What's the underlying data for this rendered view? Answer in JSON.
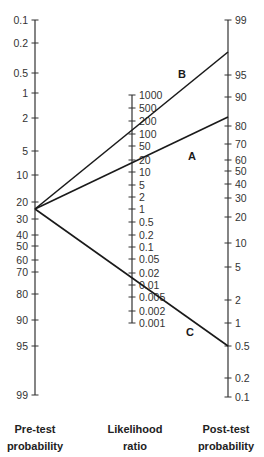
{
  "figure": {
    "type": "Fagan nomogram",
    "axes": {
      "pretest": {
        "caption_line1": "Pre-test",
        "caption_line2": "probability",
        "x": 35,
        "ticks": [
          {
            "label": "0.1",
            "y": 20
          },
          {
            "label": "0.2",
            "y": 43
          },
          {
            "label": "0.5",
            "y": 73
          },
          {
            "label": "1",
            "y": 93
          },
          {
            "label": "2",
            "y": 118
          },
          {
            "label": "5",
            "y": 151
          },
          {
            "label": "10",
            "y": 175
          },
          {
            "label": "20",
            "y": 202
          },
          {
            "label": "30",
            "y": 219
          },
          {
            "label": "40",
            "y": 235
          },
          {
            "label": "50",
            "y": 246
          },
          {
            "label": "60",
            "y": 260
          },
          {
            "label": "70",
            "y": 272
          },
          {
            "label": "80",
            "y": 294
          },
          {
            "label": "90",
            "y": 320
          },
          {
            "label": "95",
            "y": 346
          },
          {
            "label": "99",
            "y": 395
          }
        ]
      },
      "likelihood_ratio": {
        "caption_line1": "Likelihood",
        "caption_line2": "ratio",
        "x": 132,
        "ticks": [
          {
            "label": "1000",
            "y": 95
          },
          {
            "label": "500",
            "y": 108
          },
          {
            "label": "200",
            "y": 121
          },
          {
            "label": "100",
            "y": 134
          },
          {
            "label": "50",
            "y": 146
          },
          {
            "label": "20",
            "y": 160
          },
          {
            "label": "10",
            "y": 172
          },
          {
            "label": "5",
            "y": 185
          },
          {
            "label": "2",
            "y": 197
          },
          {
            "label": "1",
            "y": 209
          },
          {
            "label": "0.5",
            "y": 222
          },
          {
            "label": "0.2",
            "y": 235
          },
          {
            "label": "0.1",
            "y": 247
          },
          {
            "label": "0.05",
            "y": 259
          },
          {
            "label": "0.02",
            "y": 273
          },
          {
            "label": "0.01",
            "y": 285
          },
          {
            "label": "0.005",
            "y": 297
          },
          {
            "label": "0.002",
            "y": 311
          },
          {
            "label": "0.001",
            "y": 323
          }
        ]
      },
      "posttest": {
        "caption_line1": "Post-test",
        "caption_line2": "probability",
        "x": 228,
        "ticks": [
          {
            "label": "99",
            "y": 20
          },
          {
            "label": "95",
            "y": 75
          },
          {
            "label": "90",
            "y": 97
          },
          {
            "label": "80",
            "y": 126
          },
          {
            "label": "70",
            "y": 144
          },
          {
            "label": "60",
            "y": 160
          },
          {
            "label": "50",
            "y": 171
          },
          {
            "label": "40",
            "y": 184
          },
          {
            "label": "30",
            "y": 198
          },
          {
            "label": "20",
            "y": 217
          },
          {
            "label": "10",
            "y": 243
          },
          {
            "label": "5",
            "y": 267
          },
          {
            "label": "2",
            "y": 300
          },
          {
            "label": "1",
            "y": 323
          },
          {
            "label": "0.5",
            "y": 346
          },
          {
            "label": "0.2",
            "y": 378
          },
          {
            "label": "0.1",
            "y": 397
          }
        ]
      }
    },
    "lines": [
      {
        "name": "B",
        "pretest": "25",
        "lr": "100",
        "posttest": "97",
        "x1": 35,
        "y1": 209,
        "x2": 228,
        "y2": 52,
        "label_x": 178,
        "label_y": 78
      },
      {
        "name": "A",
        "pretest": "25",
        "lr": "20",
        "posttest": "83",
        "x1": 35,
        "y1": 209,
        "x2": 228,
        "y2": 117,
        "label_x": 188,
        "label_y": 160
      },
      {
        "name": "C",
        "pretest": "25",
        "lr": "0.01",
        "posttest": "0.5",
        "x1": 35,
        "y1": 209,
        "x2": 228,
        "y2": 346,
        "label_x": 186,
        "label_y": 336
      }
    ],
    "colors": {
      "axis": "#333333",
      "line": "#1a1a1a",
      "text": "#333333"
    }
  }
}
